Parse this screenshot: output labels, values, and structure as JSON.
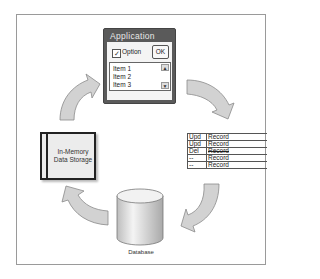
{
  "diagram": {
    "application_window": {
      "title": "Application",
      "checkbox_label": "Option",
      "checkbox_checked": true,
      "checkbox_glyph": "✓",
      "ok_button": "OK",
      "list_items": [
        "Item 1",
        "Item 2",
        "Item 3"
      ],
      "scroll_up_glyph": "▲",
      "scroll_down_glyph": "▼"
    },
    "record_table": {
      "rows": [
        {
          "op": "Upd",
          "value": "Record",
          "struck": false
        },
        {
          "op": "Upd",
          "value": "Record",
          "struck": false
        },
        {
          "op": "Del",
          "value": "Record",
          "struck": true
        },
        {
          "op": "--",
          "value": "Record",
          "struck": false
        },
        {
          "op": "--",
          "value": "Record",
          "struck": false
        }
      ]
    },
    "memory_store": {
      "line1": "In-Memory",
      "line2": "Data Storage"
    },
    "database": {
      "label": "Database"
    },
    "colors": {
      "arrow_fill": "#d2d2d2",
      "arrow_stroke": "#8a8a8a",
      "window_title_bg": "#5a5a5a",
      "frame_border": "#9a9a9a"
    }
  }
}
